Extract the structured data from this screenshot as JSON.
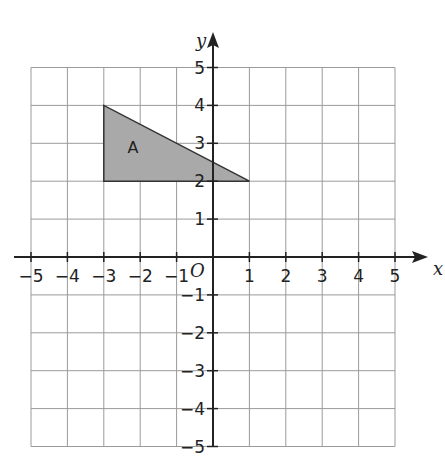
{
  "graph": {
    "x_axis": {
      "name": "x",
      "min": -5,
      "max": 5,
      "tick_labels": [
        "-5",
        "-4",
        "-3",
        "-2",
        "-1",
        "1",
        "2",
        "3",
        "4",
        "5"
      ]
    },
    "y_axis": {
      "name": "y",
      "min": -5,
      "max": 5,
      "tick_labels": [
        "5",
        "4",
        "3",
        "2",
        "1",
        "-1",
        "-2",
        "-3",
        "-4",
        "-5"
      ]
    },
    "origin_label": "O",
    "grid": true,
    "colors": {
      "grid": "#9a9a9a",
      "axis": "#222222",
      "shape_fill": "#a9a9a9",
      "shape_stroke": "#333333"
    }
  },
  "shapes": [
    {
      "label": "A",
      "type": "triangle",
      "vertices": [
        [
          -3,
          4
        ],
        [
          -3,
          2
        ],
        [
          1,
          2
        ]
      ]
    }
  ]
}
